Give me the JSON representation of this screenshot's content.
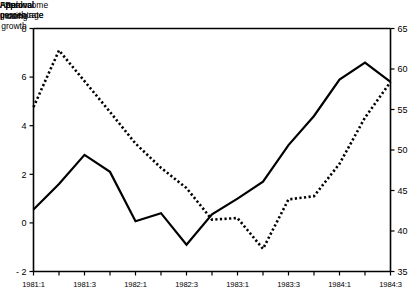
{
  "chart_data": {
    "type": "line",
    "title": "",
    "xlabel": "",
    "categories": [
      "1981:1",
      "1981:2",
      "1981:3",
      "1981:4",
      "1982:1",
      "1982:2",
      "1982:3",
      "1982:4",
      "1983:1",
      "1983:2",
      "1983:3",
      "1983:4",
      "1984:1",
      "1984:2",
      "1984:3"
    ],
    "xtick_labels": [
      "1981:1",
      "1981:3",
      "1982:1",
      "1982:3",
      "1983:1",
      "1983:3",
      "1984:1",
      "1984:3"
    ],
    "grid": false,
    "legend": "inline-annotations",
    "left_axis": {
      "label": "Real income\ngrowth rate",
      "ylim": [
        -2,
        8
      ],
      "ticks": [
        -2,
        0,
        2,
        4,
        6,
        8
      ],
      "tick_labels": [
        "- 2",
        "0",
        "2",
        "4",
        "6",
        "8"
      ]
    },
    "right_axis": {
      "label": "Approval\npercentage",
      "ylim": [
        35,
        65
      ],
      "ticks": [
        35,
        40,
        45,
        50,
        55,
        60,
        65
      ],
      "tick_labels": [
        "35",
        "40",
        "45",
        "50",
        "55",
        "60",
        "65"
      ]
    },
    "series": [
      {
        "name": "Real income growth",
        "annotation": "Real\nIncome\ngrowth",
        "axis": "left",
        "style": "solid",
        "color": "#000000",
        "values": [
          0.55,
          1.6,
          2.8,
          2.1,
          0.07,
          0.4,
          -0.9,
          0.35,
          1.0,
          1.7,
          3.2,
          4.4,
          5.9,
          6.6,
          5.8
        ]
      },
      {
        "name": "Approval rating",
        "annotation": "Approval\nrating",
        "axis": "right",
        "style": "dotted",
        "color": "#000000",
        "values": [
          55.3,
          62.3,
          58.5,
          54.7,
          50.8,
          47.8,
          45.3,
          41.4,
          41.6,
          37.8,
          43.9,
          44.3,
          48.3,
          54.0,
          58.4
        ]
      }
    ]
  }
}
